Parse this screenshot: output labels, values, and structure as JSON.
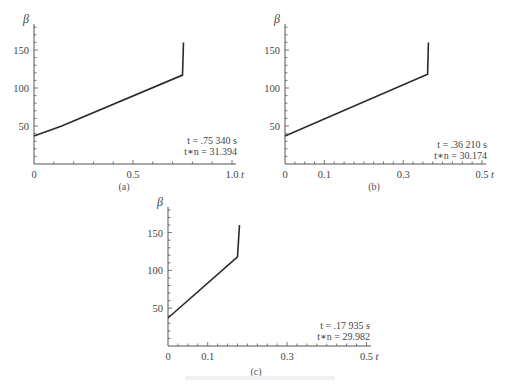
{
  "chart_data": [
    {
      "id": "a",
      "type": "line",
      "subtitle": "(a)",
      "ylabel": "β",
      "xlabel": "t",
      "xlim": [
        0,
        1.0
      ],
      "ylim": [
        0,
        175
      ],
      "xticks": [
        {
          "v": 0,
          "label": "0"
        },
        {
          "v": 0.5,
          "label": "0.5"
        },
        {
          "v": 1.0,
          "label": "1.0"
        }
      ],
      "yticks": [
        50,
        100,
        150
      ],
      "x": [
        0,
        0.14,
        0.75,
        0.755
      ],
      "y": [
        37,
        50,
        117,
        160
      ],
      "annotation": [
        "t = .75 340 s",
        "t∗n = 31.394"
      ],
      "frame": {
        "ox": 34,
        "oy": 164,
        "xpx": 198,
        "ypx": 0.76,
        "xend": 232,
        "ytop": 24,
        "minor_x": 0.1,
        "minor_y": 10
      },
      "ann_pos": {
        "x": 237,
        "y": 144
      },
      "sub_pos": {
        "x": 124,
        "y": 190
      },
      "ylab_pos": {
        "x": 23,
        "y": 23
      }
    },
    {
      "id": "b",
      "type": "line",
      "subtitle": "(b)",
      "ylabel": "β",
      "xlabel": "t",
      "xlim": [
        0,
        0.5
      ],
      "ylim": [
        0,
        175
      ],
      "xticks": [
        {
          "v": 0,
          "label": "0"
        },
        {
          "v": 0.1,
          "label": "0.1"
        },
        {
          "v": 0.3,
          "label": "0.3"
        },
        {
          "v": 0.5,
          "label": "0.5"
        }
      ],
      "yticks": [
        50,
        100,
        150
      ],
      "x": [
        0,
        0.362,
        0.364
      ],
      "y": [
        37,
        118,
        160
      ],
      "annotation": [
        "t = .36 210 s",
        "t∗n = 30.174"
      ],
      "frame": {
        "ox": 285,
        "oy": 164,
        "xpx": 394,
        "ypx": 0.76,
        "xend": 482,
        "ytop": 24,
        "minor_x": 0.025,
        "minor_y": 10
      },
      "ann_pos": {
        "x": 487,
        "y": 148
      },
      "sub_pos": {
        "x": 374,
        "y": 190
      },
      "ylab_pos": {
        "x": 274,
        "y": 23
      }
    },
    {
      "id": "c",
      "type": "line",
      "subtitle": "(c)",
      "ylabel": "β",
      "xlabel": "t",
      "xlim": [
        0,
        0.5
      ],
      "ylim": [
        0,
        175
      ],
      "xticks": [
        {
          "v": 0,
          "label": "0"
        },
        {
          "v": 0.1,
          "label": "0.1"
        },
        {
          "v": 0.3,
          "label": "0.3"
        },
        {
          "v": 0.5,
          "label": "0.5"
        }
      ],
      "yticks": [
        50,
        100,
        150
      ],
      "x": [
        0,
        0.175,
        0.18
      ],
      "y": [
        37,
        118,
        160
      ],
      "annotation": [
        "t = .17 935 s",
        "t∗n = 29.982"
      ],
      "frame": {
        "ox": 168,
        "oy": 346,
        "xpx": 397,
        "ypx": 0.756,
        "xend": 367,
        "ytop": 207,
        "minor_x": 0.025,
        "minor_y": 10
      },
      "ann_pos": {
        "x": 370,
        "y": 329
      },
      "sub_pos": {
        "x": 256,
        "y": 375
      },
      "ylab_pos": {
        "x": 157,
        "y": 206
      }
    }
  ]
}
